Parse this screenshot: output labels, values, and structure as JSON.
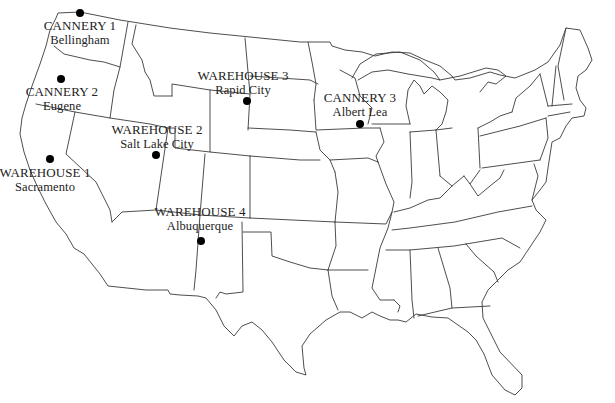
{
  "map": {
    "region": "Contiguous United States",
    "line_color": "#3a3a3a",
    "marker_color": "#000000",
    "sites": [
      {
        "id": "cannery-1",
        "name": "CANNERY 1",
        "city": "Bellingham",
        "dot": {
          "x": 80,
          "y": 13
        },
        "label": {
          "x": 80,
          "y": 19
        }
      },
      {
        "id": "cannery-2",
        "name": "CANNERY 2",
        "city": "Eugene",
        "dot": {
          "x": 61,
          "y": 79
        },
        "label": {
          "x": 62,
          "y": 85
        }
      },
      {
        "id": "cannery-3",
        "name": "CANNERY 3",
        "city": "Albert Lea",
        "dot": {
          "x": 360,
          "y": 124
        },
        "label": {
          "x": 360,
          "y": 91
        }
      },
      {
        "id": "warehouse-1",
        "name": "WAREHOUSE 1",
        "city": "Sacramento",
        "dot": {
          "x": 50,
          "y": 159
        },
        "label": {
          "x": 45,
          "y": 166
        }
      },
      {
        "id": "warehouse-2",
        "name": "WAREHOUSE 2",
        "city": "Salt Lake City",
        "dot": {
          "x": 156,
          "y": 155
        },
        "label": {
          "x": 157,
          "y": 123
        }
      },
      {
        "id": "warehouse-3",
        "name": "WAREHOUSE 3",
        "city": "Rapid City",
        "dot": {
          "x": 247,
          "y": 101
        },
        "label": {
          "x": 243,
          "y": 69
        }
      },
      {
        "id": "warehouse-4",
        "name": "WAREHOUSE 4",
        "city": "Albuquerque",
        "dot": {
          "x": 201,
          "y": 241
        },
        "label": {
          "x": 200,
          "y": 205
        }
      }
    ]
  }
}
